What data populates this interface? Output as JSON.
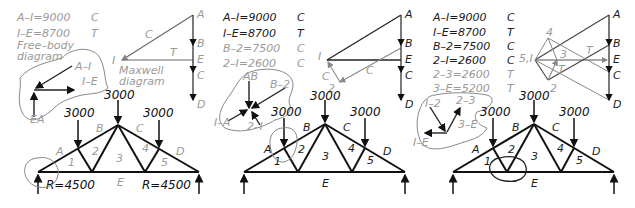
{
  "panels": [
    {
      "equations": [
        {
          "text": "A–I=9000",
          "type": "C",
          "shade": "grey"
        },
        {
          "text": "I–E=8700",
          "type": "T",
          "shade": "grey"
        }
      ],
      "free_body_label": "Free–body\ndiagram",
      "free_body_line1": "Free–body",
      "free_body_line2": "diagram",
      "maxwell_label_line1": "Maxwell",
      "maxwell_label_line2": "diagram",
      "fbd_vectors": [
        "A–I",
        "I–E",
        "EA"
      ],
      "maxwell_points": [
        "A",
        "B",
        "E",
        "C",
        "D",
        "I"
      ],
      "maxwell_member_labels": [
        "C",
        "T"
      ],
      "loads": [
        "3000",
        "3000",
        "3000"
      ],
      "zones": [
        "A",
        "B",
        "C",
        "D",
        "E",
        "1",
        "2",
        "3",
        "4",
        "5"
      ],
      "reactions": [
        "R=4500",
        "R=4500"
      ]
    },
    {
      "equations": [
        {
          "text": "A–I=9000",
          "type": "C",
          "shade": "dark"
        },
        {
          "text": "I–E=8700",
          "type": "T",
          "shade": "dark"
        },
        {
          "text": "B–2=7500",
          "type": "C",
          "shade": "grey"
        },
        {
          "text": "2–I=2600",
          "type": "C",
          "shade": "grey"
        }
      ],
      "fbd_vectors": [
        "AB",
        "B–2",
        "I–A",
        "2–I"
      ],
      "maxwell_points": [
        "A",
        "B",
        "E",
        "C",
        "D",
        "I",
        "2"
      ],
      "maxwell_member_labels": [
        "C",
        "C"
      ],
      "loads": [
        "3000",
        "3000",
        "3000"
      ],
      "zones": [
        "A",
        "B",
        "C",
        "D",
        "E",
        "1",
        "2",
        "3",
        "4",
        "5"
      ]
    },
    {
      "equations": [
        {
          "text": "A–I=9000",
          "type": "C",
          "shade": "dark"
        },
        {
          "text": "I–E=8700",
          "type": "T",
          "shade": "dark"
        },
        {
          "text": "B–2=7500",
          "type": "C",
          "shade": "dark"
        },
        {
          "text": "2–I=2600",
          "type": "C",
          "shade": "dark"
        },
        {
          "text": "2–3=2600",
          "type": "T",
          "shade": "grey"
        },
        {
          "text": "3–E=5200",
          "type": "T",
          "shade": "grey"
        }
      ],
      "fbd_vectors": [
        "I–2",
        "2–3",
        "3–E",
        "I–E"
      ],
      "maxwell_points": [
        "A",
        "B",
        "E",
        "C",
        "D",
        "5,I",
        "2",
        "3",
        "4"
      ],
      "maxwell_member_labels": [
        "T",
        "T"
      ],
      "loads": [
        "3000",
        "3000",
        "3000"
      ],
      "zones": [
        "A",
        "B",
        "C",
        "D",
        "E",
        "1",
        "2",
        "3",
        "4",
        "5"
      ]
    }
  ]
}
